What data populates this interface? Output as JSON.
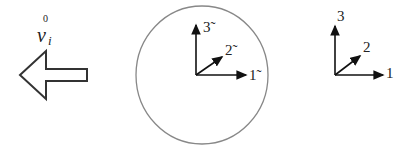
{
  "diagram": {
    "velocity_arrow": {
      "label_main": "v",
      "label_sub": "i",
      "label_sup": "0",
      "direction": "left"
    },
    "body_frame": {
      "shape": "circle",
      "axes": [
        {
          "label": "1̃",
          "direction": "right"
        },
        {
          "label": "2̃",
          "direction": "diagonal"
        },
        {
          "label": "3̃",
          "direction": "up"
        }
      ]
    },
    "reference_frame": {
      "axes": [
        {
          "label": "1",
          "direction": "right"
        },
        {
          "label": "2",
          "direction": "diagonal"
        },
        {
          "label": "3",
          "direction": "up"
        }
      ]
    },
    "colors": {
      "stroke": "#111111",
      "circle": "#777777"
    }
  }
}
